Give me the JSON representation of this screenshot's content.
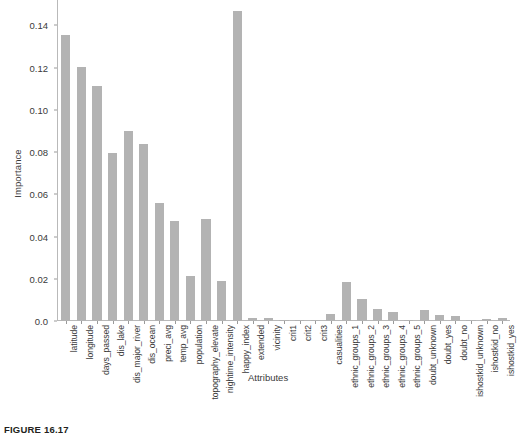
{
  "figure": {
    "caption": "FIGURE 16.17"
  },
  "chart_data": {
    "type": "bar",
    "title": "",
    "xlabel": "Attributes",
    "ylabel": "Importance",
    "ylim": [
      0.0,
      0.152
    ],
    "grid": false,
    "legend": null,
    "ytick_labels": [
      "0.0",
      "0.02",
      "0.04",
      "0.06",
      "0.08",
      "0.10",
      "0.12",
      "0.14"
    ],
    "ytick_values": [
      0.0,
      0.02,
      0.04,
      0.06,
      0.08,
      0.1,
      0.12,
      0.14
    ],
    "bar_color": "#b3b3b3",
    "categories": [
      "latitude",
      "longitude",
      "days_passed",
      "dis_lake",
      "dis_major_river",
      "dis_ocean",
      "preci_avg",
      "temp_avg",
      "population",
      "topography_elevate",
      "nightime_intensity",
      "happy_index",
      "extended",
      "vicinity",
      "crit1",
      "crit2",
      "crit3",
      "casualities",
      "ethnic_groups_1",
      "ethnic_groups_2",
      "ethnic_groups_3",
      "ethnic_groups_4",
      "ethnic_groups_5",
      "doubt_unknown",
      "doubt_yes",
      "doubt_no",
      "ishostkid_unknown",
      "ishostkid_no",
      "ishostkid_yes"
    ],
    "values": [
      0.1355,
      0.1203,
      0.1115,
      0.0795,
      0.09,
      0.0837,
      0.0558,
      0.0473,
      0.0211,
      0.0482,
      0.0191,
      0.1468,
      0.0012,
      0.0014,
      0.0003,
      0.0002,
      0.0005,
      0.0035,
      0.0187,
      0.0105,
      0.0057,
      0.0044,
      0.0002,
      0.0053,
      0.0028,
      0.0026,
      0.0002,
      0.0011,
      0.0013
    ]
  }
}
